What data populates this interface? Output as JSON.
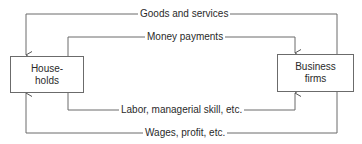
{
  "diagram": {
    "type": "circular-flow",
    "nodes": {
      "households": {
        "line1": "House-",
        "line2": "holds"
      },
      "firms": {
        "line1": "Business",
        "line2": "firms"
      }
    },
    "flows": {
      "goods": {
        "label": "Goods and services",
        "from": "Business firms",
        "to": "Households"
      },
      "money": {
        "label": "Money payments",
        "from": "Households",
        "to": "Business firms"
      },
      "labor": {
        "label": "Labor, managerial skill, etc.",
        "from": "Households",
        "to": "Business firms"
      },
      "wages": {
        "label": "Wages, profit, etc.",
        "from": "Business firms",
        "to": "Households"
      }
    },
    "colors": {
      "line": "#6b6b6b",
      "text": "#2a2a2a",
      "background": "#ffffff"
    }
  }
}
